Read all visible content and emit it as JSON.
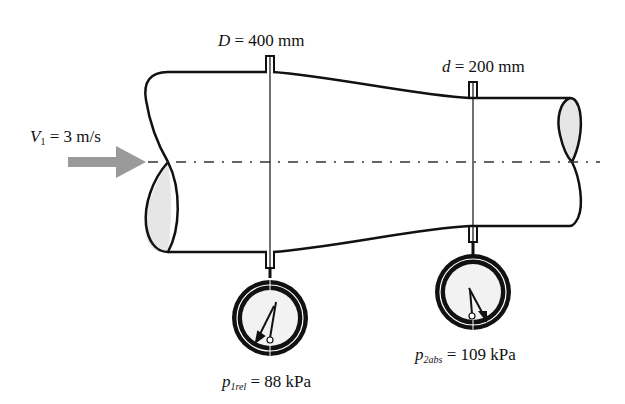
{
  "diagram": {
    "inlet": {
      "diameter_symbol": "D",
      "diameter_eq": " = 400 mm",
      "velocity_symbol": "V",
      "velocity_subscript": "1",
      "velocity_eq": " = 3 m/s"
    },
    "throat": {
      "diameter_symbol": "d",
      "diameter_eq": " = 200 mm"
    },
    "gauge1": {
      "symbol": "p",
      "subscript": "1rel",
      "value_eq": " = 88 kPa"
    },
    "gauge2": {
      "symbol": "p",
      "subscript": "2abs",
      "value_eq": " = 109 kPa"
    },
    "colors": {
      "line": "#111111",
      "arrow": "#9a9a9a",
      "section_fill": "#e6e6e6",
      "gauge_face": "#f2f2f2"
    }
  }
}
